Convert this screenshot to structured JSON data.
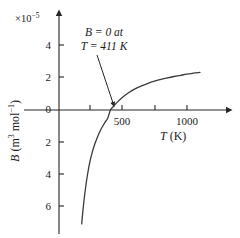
{
  "figure": {
    "axis_color": "#262626",
    "curve_color": "#3a3a3a",
    "background": "#ffffff"
  },
  "exponent_label": "×10",
  "exponent_power": "−5",
  "y_axis_title_main": "B",
  "y_axis_title_units": " (m",
  "y_axis_title_sup1": "3",
  "y_axis_title_mid": " mol",
  "y_axis_title_sup2": "−1",
  "y_axis_title_end": ")",
  "x_axis_title_symbol": "T",
  "x_axis_title_units": " (K)",
  "annotation": {
    "line1": "B = 0 at",
    "line2": "T = 411 K"
  },
  "y_ticks": [
    {
      "label": "4",
      "value": 4
    },
    {
      "label": "2",
      "value": 2
    },
    {
      "label": "0",
      "value": 0
    },
    {
      "label": "2",
      "value": -2
    },
    {
      "label": "4",
      "value": -4
    },
    {
      "label": "6",
      "value": -6
    }
  ],
  "x_ticks": [
    {
      "label": "",
      "value": 200
    },
    {
      "label": "500",
      "value": 500
    },
    {
      "label": "",
      "value": 800
    },
    {
      "label": "1000",
      "value": 1000
    }
  ],
  "chart_data": {
    "type": "line",
    "title": "",
    "subtitle": "",
    "xlabel": "T (K)",
    "ylabel": "B (m^3 mol^-1)",
    "y_scale_exponent": -5,
    "y_scale_label": "×10^-5",
    "xlim": [
      150,
      1150
    ],
    "ylim": [
      -7.0,
      5.0
    ],
    "grid": false,
    "legend": null,
    "annotations": [
      {
        "text": "B = 0 at T = 411 K",
        "text_x": 430,
        "text_y": 4.1,
        "arrow_to_x": 411,
        "arrow_to_y": 0.0
      }
    ],
    "x_tick_values": [
      200,
      500,
      800,
      1000
    ],
    "x_tick_labels": [
      "",
      "500",
      "",
      "1000"
    ],
    "y_tick_values": [
      4,
      2,
      0,
      -2,
      -4,
      -6
    ],
    "y_tick_labels": [
      "4",
      "2",
      "0",
      "2",
      "4",
      "6"
    ],
    "series": [
      {
        "name": "B(T)",
        "x": [
          190,
          200,
          215,
          230,
          250,
          270,
          290,
          310,
          330,
          350,
          370,
          390,
          411,
          430,
          460,
          500,
          550,
          600,
          650,
          700,
          750,
          800,
          850,
          900,
          950,
          1000,
          1050,
          1100
        ],
        "y": [
          -6.9,
          -6.05,
          -5.0,
          -4.15,
          -3.25,
          -2.6,
          -2.08,
          -1.66,
          -1.3,
          -1.0,
          -0.73,
          -0.5,
          0.0,
          0.18,
          0.45,
          0.75,
          1.05,
          1.28,
          1.46,
          1.62,
          1.75,
          1.86,
          1.95,
          2.03,
          2.1,
          2.17,
          2.23,
          2.28
        ]
      }
    ],
    "zero_crossing": {
      "x": 411,
      "y": 0
    }
  }
}
